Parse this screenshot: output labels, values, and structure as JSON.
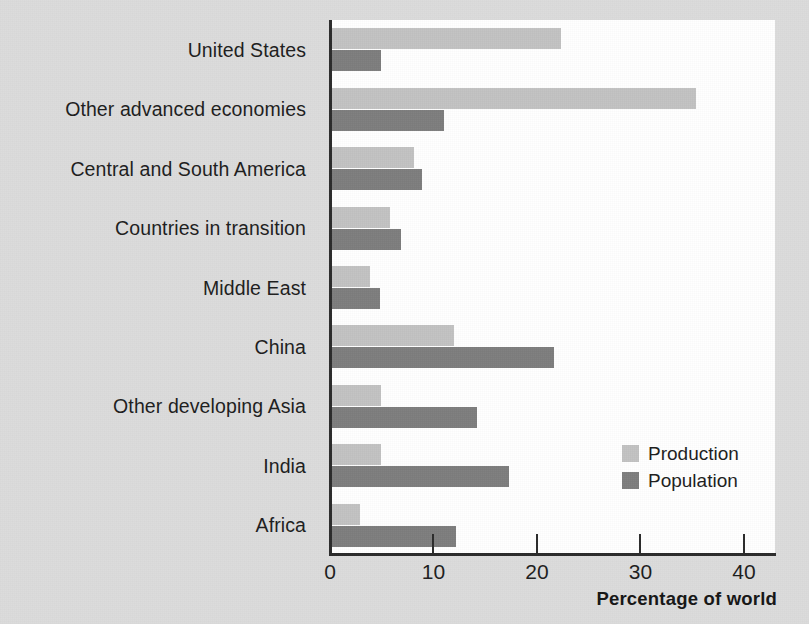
{
  "chart_data": {
    "type": "bar",
    "orientation": "horizontal",
    "title": "",
    "xlabel": "Percentage of world",
    "ylabel": "",
    "xlim": [
      0,
      43
    ],
    "grid": false,
    "legend_position": "inside-lower-right",
    "categories": [
      "United States",
      "Other advanced economies",
      "Central and South America",
      "Countries in transition",
      "Middle East",
      "China",
      "Other developing Asia",
      "India",
      "Africa"
    ],
    "xticks": [
      0,
      10,
      20,
      30,
      40
    ],
    "xtick_labels": [
      "0",
      "10",
      "20",
      "30",
      "40"
    ],
    "series": [
      {
        "name": "Production",
        "color": "#c2c2c2",
        "values": [
          22.3,
          35.4,
          8.1,
          5.8,
          3.9,
          12.0,
          4.9,
          4.9,
          2.9
        ]
      },
      {
        "name": "Population",
        "color": "#7d7d7d",
        "values": [
          4.9,
          11.0,
          8.9,
          6.9,
          4.8,
          21.6,
          14.2,
          17.3,
          12.2
        ]
      }
    ]
  },
  "colors": {
    "page_background": "#dcdcdc",
    "plot_background": "#ffffff",
    "axis": "#2b2b2b",
    "text": "#1d1d1d",
    "production": "#c2c2c2",
    "population": "#7d7d7d"
  }
}
